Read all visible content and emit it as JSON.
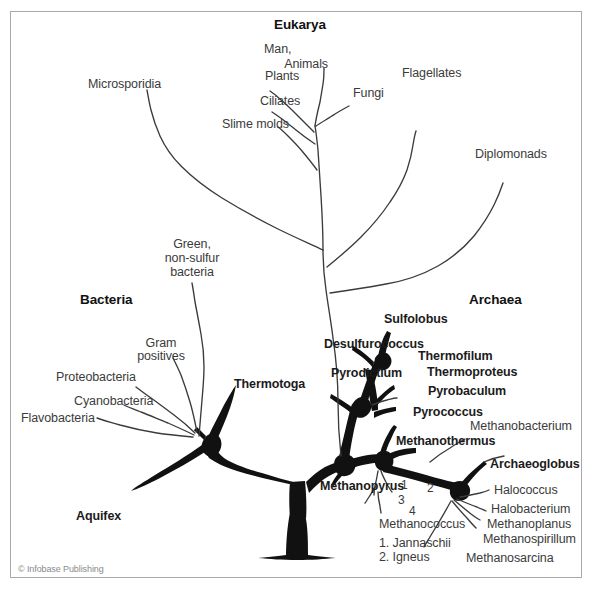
{
  "figure": {
    "credit": "© Infobase Publishing",
    "frame_color": "#a9a9a9",
    "background_color": "#ffffff",
    "line_color": "#3b3b3b",
    "trunk_color": "#111111"
  },
  "domains": [
    {
      "id": "bacteria",
      "label": "Bacteria"
    },
    {
      "id": "eukarya",
      "label": "Eukarya"
    },
    {
      "id": "archaea",
      "label": "Archaea"
    }
  ],
  "eukarya_taxa": [
    {
      "label": "Microsporidia"
    },
    {
      "label": "Plants"
    },
    {
      "label": "Ciliates"
    },
    {
      "label": "Slime molds"
    },
    {
      "label": "Man,\nAnimals"
    },
    {
      "label": "Fungi"
    },
    {
      "label": "Flagellates"
    },
    {
      "label": "Diplomonads"
    }
  ],
  "bacteria_taxa": [
    {
      "label": "Green,\nnon-sulfur\nbacteria",
      "bold": false
    },
    {
      "label": "Gram\npositives",
      "bold": false
    },
    {
      "label": "Proteobacteria",
      "bold": false
    },
    {
      "label": "Cyanobacteria",
      "bold": false
    },
    {
      "label": "Flavobacteria",
      "bold": false
    },
    {
      "label": "Thermotoga",
      "bold": true
    },
    {
      "label": "Aquifex",
      "bold": true
    }
  ],
  "archaea_taxa": [
    {
      "label": "Sulfolobus",
      "bold": true
    },
    {
      "label": "Desulfurococcus",
      "bold": true
    },
    {
      "label": "Pyrodictium",
      "bold": true
    },
    {
      "label": "Thermofilum",
      "bold": true
    },
    {
      "label": "Thermoproteus",
      "bold": true
    },
    {
      "label": "Pyrobaculum",
      "bold": true
    },
    {
      "label": "Pyrococcus",
      "bold": true
    },
    {
      "label": "Methanothermus",
      "bold": true
    },
    {
      "label": "Methanopyrus",
      "bold": true
    },
    {
      "label": "Archaeoglobus",
      "bold": true
    },
    {
      "label": "Methanobacterium",
      "bold": false
    },
    {
      "label": "Halococcus",
      "bold": false
    },
    {
      "label": "Halobacterium",
      "bold": false
    },
    {
      "label": "Methanoplanus",
      "bold": false
    },
    {
      "label": "Methanospirillum",
      "bold": false
    },
    {
      "label": "Methanosarcina",
      "bold": false
    }
  ],
  "methanococcus": {
    "group_label": "Methanococcus",
    "branch_numbers": [
      "1",
      "2",
      "3",
      "4"
    ],
    "legend": [
      "1. Jannaschii",
      "2. Igneus"
    ]
  },
  "labels": {
    "microsporidia": "Microsporidia",
    "plants": "Plants",
    "ciliates": "Ciliates",
    "slime_molds": "Slime molds",
    "man_animals_line1": "Man,",
    "man_animals_line2": "Animals",
    "fungi": "Fungi",
    "flagellates": "Flagellates",
    "diplomonads": "Diplomonads",
    "eukarya": "Eukarya",
    "bacteria": "Bacteria",
    "archaea": "Archaea",
    "green_line1": "Green,",
    "green_line2": "non-sulfur",
    "green_line3": "bacteria",
    "gram_line1": "Gram",
    "gram_line2": "positives",
    "proteobacteria": "Proteobacteria",
    "cyanobacteria": "Cyanobacteria",
    "flavobacteria": "Flavobacteria",
    "thermotoga": "Thermotoga",
    "aquifex": "Aquifex",
    "sulfolobus": "Sulfolobus",
    "desulfurococcus": "Desulfurococcus",
    "pyrodictium": "Pyrodictium",
    "thermofilum": "Thermofilum",
    "thermoproteus": "Thermoproteus",
    "pyrobaculum": "Pyrobaculum",
    "pyrococcus": "Pyrococcus",
    "methanothermus": "Methanothermus",
    "methanopyrus": "Methanopyrus",
    "archaeoglobus": "Archaeoglobus",
    "methanobacterium": "Methanobacterium",
    "halococcus": "Halococcus",
    "halobacterium": "Halobacterium",
    "methanoplanus": "Methanoplanus",
    "methanospirillum": "Methanospirillum",
    "methanosarcina": "Methanosarcina",
    "methanococcus": "Methanococcus",
    "num1": "1",
    "num2": "2",
    "num3": "3",
    "num4": "4",
    "legend1": "1. Jannaschii",
    "legend2": "2. Igneus",
    "credit": "© Infobase Publishing"
  }
}
